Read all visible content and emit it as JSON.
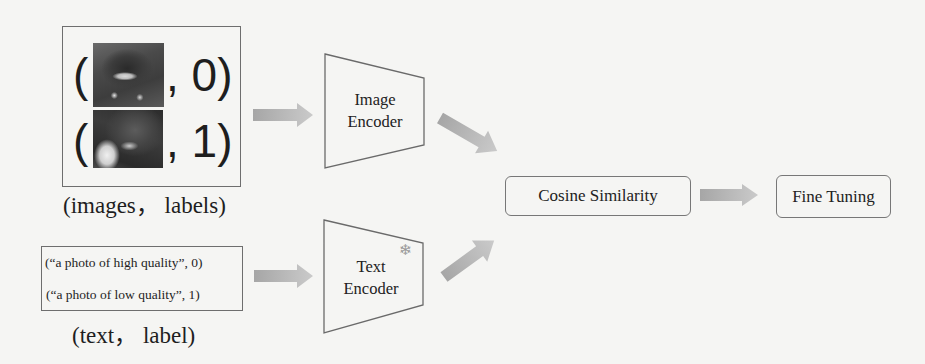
{
  "diagram": {
    "image_input": {
      "items": [
        {
          "thumbnail": "photo-high-quality",
          "label": "0",
          "text": ", 0)"
        },
        {
          "thumbnail": "photo-low-quality",
          "label": "1",
          "text": ", 1)"
        }
      ],
      "open_paren": "(",
      "caption": "(images， labels)"
    },
    "text_input": {
      "lines": [
        "(“a photo of high quality”, 0)",
        "(“a photo of low quality”, 1)"
      ],
      "caption": "(text， label)"
    },
    "image_encoder": {
      "line1": "Image",
      "line2": "Encoder"
    },
    "text_encoder": {
      "line1": "Text",
      "line2": "Encoder",
      "frozen_icon": "❄",
      "frozen_icon_name": "snowflake-icon"
    },
    "cosine_similarity": {
      "label": "Cosine Similarity"
    },
    "fine_tuning": {
      "label": "Fine Tuning"
    },
    "colors": {
      "background": "#f5f5f3",
      "stroke": "#6e6e6e",
      "arrow_start": "#a6a6a6",
      "arrow_end": "#cacaca",
      "text": "#222222"
    },
    "edges": [
      {
        "from": "image_input",
        "to": "image_encoder"
      },
      {
        "from": "text_input",
        "to": "text_encoder"
      },
      {
        "from": "image_encoder",
        "to": "cosine_similarity"
      },
      {
        "from": "text_encoder",
        "to": "cosine_similarity"
      },
      {
        "from": "cosine_similarity",
        "to": "fine_tuning"
      }
    ]
  }
}
